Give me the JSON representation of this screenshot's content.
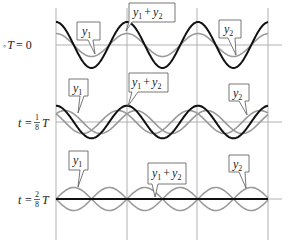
{
  "figure": {
    "colors": {
      "sum_wave": "#111111",
      "component_wave": "#9a9a9a",
      "grid": "#9a9a9a",
      "callout_border": "#555555"
    },
    "panels": [
      {
        "time_label": {
          "prefix": "◦T = 0",
          "text": "t = 0"
        },
        "callouts": {
          "y1": "y1",
          "sum": "y1 + y2",
          "y2": "y2"
        }
      },
      {
        "time_label": {
          "text": "t = 1/8 T",
          "num": "1",
          "den": "8"
        },
        "callouts": {
          "y1": "y1",
          "sum": "y1 + y2",
          "y2": "y2"
        }
      },
      {
        "time_label": {
          "text": "t = 2/8 T",
          "num": "2",
          "den": "8"
        },
        "callouts": {
          "y1": "y1",
          "sum": "y1 + y2",
          "y2": "y2"
        }
      }
    ]
  },
  "labels": {
    "t0_left": "◦",
    "t0_var": "T",
    "eq": "= 0",
    "t": "t",
    "eq_only": "=",
    "T": "T",
    "frac1_num": "1",
    "frac1_den": "8",
    "frac2_num": "2",
    "frac2_den": "8",
    "y": "y",
    "sub1": "1",
    "sub2": "2",
    "plus": "+"
  }
}
